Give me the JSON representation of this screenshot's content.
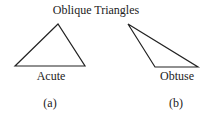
{
  "title": "Oblique Triangles",
  "triangles": [
    {
      "id": "a",
      "label": "Acute",
      "caption": "(a)",
      "points": "15,66 58,24 85,66"
    },
    {
      "id": "b",
      "label": "Obtuse",
      "caption": "(b)",
      "points": "128,24 155,67 198,67"
    }
  ],
  "colors": {
    "stroke": "#222222",
    "background": "#ffffff"
  }
}
